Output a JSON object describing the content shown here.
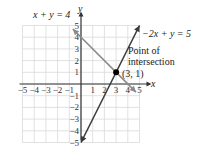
{
  "chart_data": {
    "type": "line",
    "title": "",
    "xlabel": "x",
    "ylabel": "y",
    "xlim": [
      -5,
      5
    ],
    "ylim": [
      -5,
      5
    ],
    "grid": true,
    "x_ticks": [
      "-5",
      "-4",
      "-3",
      "-2",
      "-1",
      "1",
      "2",
      "3",
      "4",
      "5"
    ],
    "y_ticks": [
      "5",
      "4",
      "3",
      "2",
      "1",
      "-1",
      "-2",
      "-3",
      "-4",
      "-5"
    ],
    "series": [
      {
        "name": "x + y = 4",
        "equation": "x + y = 4",
        "points": [
          [
            -0.7,
            4.7
          ],
          [
            4.7,
            -0.7
          ]
        ],
        "color": "#8a8a8a"
      },
      {
        "name": "-2x + y = 5",
        "equation": "-2x + y = 5",
        "points": [
          [
            0,
            -5
          ],
          [
            5,
            5
          ]
        ],
        "color": "#3a3a3a"
      }
    ],
    "annotations": [
      {
        "text": "Point of",
        "anchor": "intersection-label"
      },
      {
        "text": "intersection",
        "anchor": "intersection-label"
      },
      {
        "text": "(3, 1)",
        "x": 3,
        "y": 1
      }
    ],
    "intersection_point": {
      "x": 3,
      "y": 1,
      "label": "(3, 1)"
    }
  },
  "labels": {
    "line1": "x + y = 4",
    "line2": "−2x + y = 5",
    "poi_line1": "Point of",
    "poi_line2": "intersection",
    "point": "(3, 1)",
    "axis_x": "x",
    "axis_y": "y"
  }
}
